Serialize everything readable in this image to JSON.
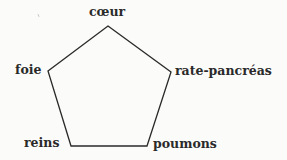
{
  "diagram": {
    "type": "pentagon",
    "line_color": "#2a2a2a",
    "text_color": "#2a2a2a",
    "background": "#fbfbf9",
    "vertices": [
      {
        "id": "top",
        "label": "cœur",
        "x": 108,
        "y": 26
      },
      {
        "id": "right",
        "label": "rate-pancréas",
        "x": 171,
        "y": 72
      },
      {
        "id": "bottom-right",
        "label": "poumons",
        "x": 147,
        "y": 146
      },
      {
        "id": "bottom-left",
        "label": "reins",
        "x": 71,
        "y": 146
      },
      {
        "id": "left",
        "label": "foie",
        "x": 48,
        "y": 71
      }
    ]
  },
  "labels": {
    "top": "cœur",
    "right": "rate-pancréas",
    "bottom_right": "poumons",
    "bottom_left": "reins",
    "left": "foie"
  }
}
